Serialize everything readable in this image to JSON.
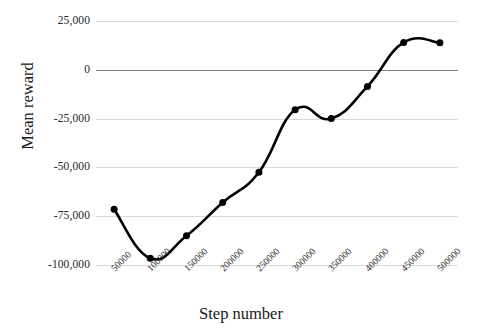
{
  "chart_data": {
    "type": "line",
    "title": "",
    "xlabel": "Step number",
    "ylabel": "Mean reward",
    "x": [
      50000,
      100000,
      150000,
      200000,
      250000,
      300000,
      350000,
      400000,
      450000,
      500000
    ],
    "categories": [
      "50000",
      "100000",
      "150000",
      "200000",
      "250000",
      "300000",
      "350000",
      "400000",
      "450000",
      "500000"
    ],
    "values": [
      -71500,
      -96500,
      -85000,
      -68000,
      -52500,
      -20500,
      -25000,
      -8500,
      14000,
      13800
    ],
    "series": [
      {
        "name": "Mean reward",
        "values": [
          -71500,
          -96500,
          -85000,
          -68000,
          -52500,
          -20500,
          -25000,
          -8500,
          14000,
          13800
        ]
      }
    ],
    "ylim": [
      -100000,
      25000
    ],
    "yticks": [
      25000,
      0,
      -25000,
      -50000,
      -75000,
      -100000
    ],
    "ytick_labels": [
      "25,000",
      "0",
      "-25,000",
      "-50,000",
      "-75,000",
      "-100,000"
    ],
    "grid": true,
    "legend": "none",
    "line_color": "#000000",
    "marker_color": "#000000",
    "gridline_color": "#D9D9D9",
    "zero_line_color": "#808080",
    "smoothed": true
  },
  "axes": {
    "y_title": "Mean reward",
    "x_title": "Step number"
  }
}
